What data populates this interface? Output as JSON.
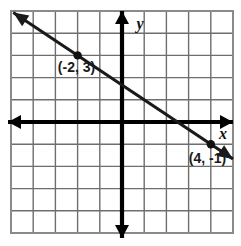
{
  "figure": {
    "kind": "coordinate-plane-graph",
    "background_color": "#ffffff",
    "grid_color": "#6e6e6e",
    "grid_border_color": "#808080",
    "axis_color": "#000000",
    "line_color": "#1a1a1a",
    "label_color": "#1a1a1a"
  },
  "axes": {
    "x_label": "x",
    "y_label": "y",
    "origin_px": {
      "x": 122,
      "y": 122
    },
    "cell_px": 22.2,
    "x_range": [
      -5,
      5
    ],
    "y_range": [
      -5,
      5
    ],
    "grid_columns": 10,
    "grid_rows": 10,
    "grid_bounds_px": {
      "left": 11,
      "top": 11,
      "right": 233,
      "bottom": 233
    },
    "x_axis_arrows": [
      "left",
      "right"
    ],
    "y_axis_arrows": [
      "up",
      "down"
    ]
  },
  "chart_data": {
    "type": "line",
    "title": "",
    "xlabel": "x",
    "ylabel": "y",
    "xlim": [
      -5,
      5
    ],
    "ylim": [
      -5,
      5
    ],
    "grid": true,
    "legend": "none",
    "series": [
      {
        "name": "line through (-2, 3) and (4, -1)",
        "x": [
          -2,
          4
        ],
        "y": [
          3,
          -1
        ],
        "slope": -0.6666667,
        "y_intercept": 1.6666667,
        "arrows": [
          "start",
          "end"
        ],
        "extended_x": [
          -4.9,
          5.0
        ],
        "extended_y": [
          4.9333,
          -1.6667
        ]
      }
    ],
    "points": [
      {
        "label": "(-2, 3)",
        "x": -2,
        "y": 3,
        "marker": "filled-circle"
      },
      {
        "label": "(4, -1)",
        "x": 4,
        "y": -1,
        "marker": "filled-circle"
      }
    ],
    "annotations": [
      {
        "text": "(-2, 3)",
        "x": -2.05,
        "y": 2.25,
        "anchor": "middle"
      },
      {
        "text": "(4, -1)",
        "x": 3.85,
        "y": -1.85,
        "anchor": "middle"
      }
    ]
  }
}
